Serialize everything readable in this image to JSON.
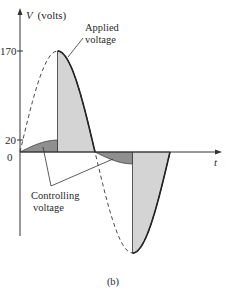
{
  "figure": {
    "y_axis_label_var": "V",
    "y_axis_label_unit": "(volts)",
    "x_axis_label": "t",
    "tick_170": "170",
    "tick_20": "20",
    "tick_0": "0",
    "applied_label_line1": "Applied",
    "applied_label_line2": "voltage",
    "controlling_label_line1": "Controlling",
    "controlling_label_line2": "voltage",
    "caption": "(b)"
  },
  "waveform": {
    "peak_volts": 170,
    "control_volts": 20,
    "colors": {
      "applied_fill": "#d4d4d4",
      "control_fill": "#8f8f8f",
      "line": "#333333"
    }
  }
}
